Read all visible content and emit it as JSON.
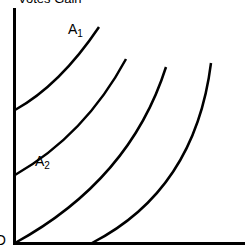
{
  "diagram": {
    "y_axis_title": "Votes Gain",
    "origin_label": "O",
    "labels": [
      {
        "main": "A",
        "sub": "1"
      },
      {
        "main": "A",
        "sub": "2"
      }
    ],
    "curves": [
      {
        "name": "A1",
        "path": "M15,110 Q60,85 99,27"
      },
      {
        "name": "A2",
        "path": "M15,175 Q85,135 126,59"
      },
      {
        "name": "A3",
        "path": "M15,243 Q130,180 166,67"
      },
      {
        "name": "A4",
        "path": "M92,243 Q195,190 211,63"
      }
    ],
    "colors": {
      "ink": "#000000",
      "background": "#ffffff"
    }
  }
}
